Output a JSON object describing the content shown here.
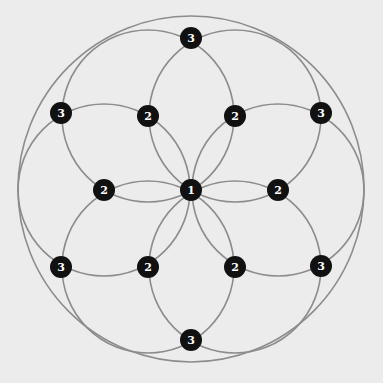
{
  "diagram": {
    "background": "#ececec",
    "line_color": "#8c8c8c",
    "node_color": "#111111",
    "label_color": "#ffffff",
    "outer_circle": {
      "cx": 191,
      "cy": 189,
      "r": 173
    },
    "petal_circles": [
      {
        "cx": 148,
        "cy": 116,
        "r": 86
      },
      {
        "cx": 235,
        "cy": 116,
        "r": 86
      },
      {
        "cx": 278,
        "cy": 190,
        "r": 86
      },
      {
        "cx": 235,
        "cy": 267,
        "r": 86
      },
      {
        "cx": 148,
        "cy": 267,
        "r": 86
      },
      {
        "cx": 104,
        "cy": 190,
        "r": 86
      }
    ],
    "nodes": [
      {
        "x": 191,
        "y": 38,
        "label": "3"
      },
      {
        "x": 61,
        "y": 113,
        "label": "3"
      },
      {
        "x": 148,
        "y": 116,
        "label": "2"
      },
      {
        "x": 235,
        "y": 116,
        "label": "2"
      },
      {
        "x": 321,
        "y": 113,
        "label": "3"
      },
      {
        "x": 104,
        "y": 190,
        "label": "2"
      },
      {
        "x": 191,
        "y": 190,
        "label": "1"
      },
      {
        "x": 278,
        "y": 190,
        "label": "2"
      },
      {
        "x": 61,
        "y": 267,
        "label": "3"
      },
      {
        "x": 148,
        "y": 267,
        "label": "2"
      },
      {
        "x": 235,
        "y": 267,
        "label": "2"
      },
      {
        "x": 321,
        "y": 266,
        "label": "3"
      },
      {
        "x": 191,
        "y": 340,
        "label": "3"
      }
    ]
  }
}
